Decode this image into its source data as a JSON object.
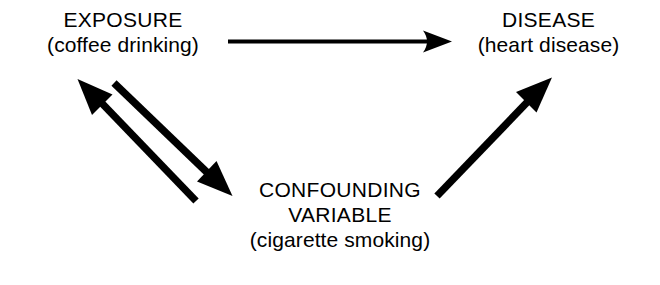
{
  "diagram": {
    "background_color": "#ffffff",
    "stroke_color": "#000000",
    "nodes": {
      "exposure": {
        "name": "EXPOSURE",
        "example": "(coffee drinking)"
      },
      "disease": {
        "name": "DISEASE",
        "example": "(heart disease)"
      },
      "confounder": {
        "name_line1": "CONFOUNDING",
        "name_line2": "VARIABLE",
        "example": "(cigarette smoking)"
      }
    },
    "arrows": [
      {
        "id": "exposure-to-disease",
        "from": "exposure",
        "to": "disease",
        "style": "thin-horizontal"
      },
      {
        "id": "confounder-to-exposure",
        "from": "confounder",
        "to": "exposure",
        "style": "thick-diagonal"
      },
      {
        "id": "exposure-to-confounder",
        "from": "exposure",
        "to": "confounder",
        "style": "thick-diagonal"
      },
      {
        "id": "confounder-to-disease",
        "from": "confounder",
        "to": "disease",
        "style": "thick-diagonal"
      }
    ]
  }
}
